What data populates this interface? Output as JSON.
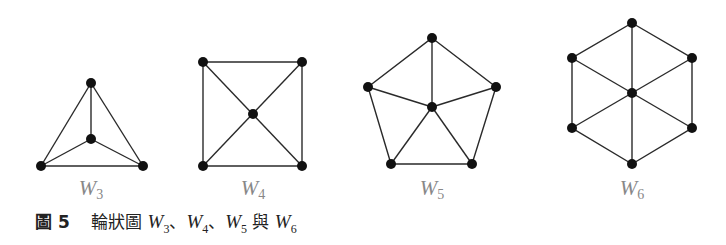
{
  "figure": {
    "caption_label": "圖 5",
    "caption_text_prefix": "輪狀圖",
    "caption_items": [
      {
        "letter": "W",
        "sub": "3",
        "sep": "、"
      },
      {
        "letter": "W",
        "sub": "4",
        "sep": "、"
      },
      {
        "letter": "W",
        "sub": "5",
        "sep": " 與 "
      },
      {
        "letter": "W",
        "sub": "6",
        "sep": ""
      }
    ]
  },
  "graphs": [
    {
      "name": "W3",
      "label_letter": "W",
      "label_sub": "3",
      "label_x": 91,
      "label_y": 176
    },
    {
      "name": "W4",
      "label_letter": "W",
      "label_sub": "4",
      "label_x": 253,
      "label_y": 176
    },
    {
      "name": "W5",
      "label_letter": "W",
      "label_sub": "5",
      "label_x": 432,
      "label_y": 176
    },
    {
      "name": "W6",
      "label_letter": "W",
      "label_sub": "6",
      "label_x": 632,
      "label_y": 176
    }
  ],
  "colors": {
    "edge": "#2a2a2a",
    "node": "#111111",
    "label": "#888888",
    "caption": "#222222"
  }
}
